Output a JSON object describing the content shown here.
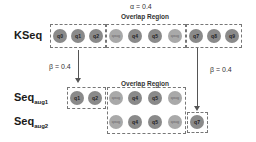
{
  "labels": {
    "kseq": "KSeq",
    "seq_aug1_main": "Seq",
    "seq_aug1_sub": "aug1",
    "seq_aug2_main": "Seq",
    "seq_aug2_sub": "aug2",
    "alpha": "α = 0.4",
    "overlap_top": "Overlap Region",
    "overlap_bottom": "Overlap Region",
    "beta_left": "β = 0.4",
    "beta_right": "β = 0.4"
  },
  "kseq": {
    "left_box": [
      "q0",
      "q1",
      "q2"
    ],
    "overlap": [
      "qaug",
      "q4",
      "q5",
      "qaug"
    ],
    "right_box": [
      "q7",
      "q8",
      "q9"
    ]
  },
  "seq_aug1": {
    "left_box": [
      "q1",
      "q2"
    ],
    "overlap": [
      "qaug",
      "q4",
      "q5",
      "qaug"
    ]
  },
  "seq_aug2": {
    "overlap": [
      "qaug",
      "q4",
      "q5",
      "qaug"
    ],
    "right_box": [
      "q7"
    ]
  }
}
